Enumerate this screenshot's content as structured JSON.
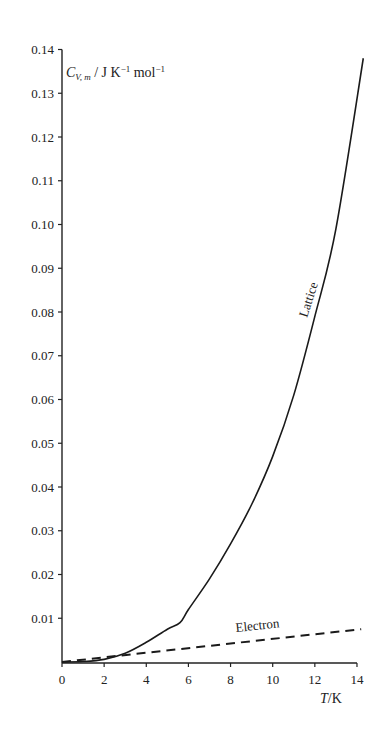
{
  "chart_data": {
    "type": "line",
    "title": "",
    "xlabel": "T/K",
    "ylabel": "C_V,m / J K^-1 mol^-1",
    "xlim": [
      0,
      14.3
    ],
    "ylim": [
      0,
      0.14
    ],
    "x_ticks": [
      0,
      2,
      4,
      6,
      8,
      10,
      12,
      14
    ],
    "x_tick_labels": [
      "0",
      "2",
      "4",
      "6",
      "8",
      "10",
      "12",
      "14"
    ],
    "y_ticks": [
      0.01,
      0.02,
      0.03,
      0.04,
      0.05,
      0.06,
      0.07,
      0.08,
      0.09,
      0.1,
      0.11,
      0.12,
      0.13,
      0.14
    ],
    "y_tick_labels": [
      "0.01",
      "0.02",
      "0.03",
      "0.04",
      "0.05",
      "0.06",
      "0.07",
      "0.08",
      "0.09",
      "0.10",
      "0.11",
      "0.12",
      "0.13",
      "0.14"
    ],
    "grid": false,
    "legend": "inline labels",
    "series": [
      {
        "name": "Lattice",
        "style": "solid",
        "x": [
          0,
          1,
          2,
          3,
          4,
          5,
          5.6,
          6,
          7,
          8,
          9,
          10,
          11,
          12,
          13,
          14.3
        ],
        "y": [
          0,
          0.0001,
          0.0006,
          0.002,
          0.0045,
          0.0075,
          0.009,
          0.012,
          0.019,
          0.027,
          0.036,
          0.047,
          0.061,
          0.079,
          0.099,
          0.138
        ]
      },
      {
        "name": "Electron",
        "style": "dashed",
        "x": [
          0,
          14.2
        ],
        "y": [
          0,
          0.0075
        ]
      }
    ],
    "annotations": [
      {
        "text": "Lattice",
        "x": 10.9,
        "y": 0.072,
        "rotation": -72
      },
      {
        "text": "Electron",
        "x": 11,
        "y": 0.0095,
        "rotation": -6
      }
    ]
  },
  "labels": {
    "y_axis_label_main": "C",
    "y_axis_label_sub": "V, m",
    "y_axis_label_units": " / J K",
    "y_axis_label_exp1": "−1",
    "y_axis_label_mol": " mol",
    "y_axis_label_exp2": "−1",
    "x_axis_label_T": "T",
    "x_axis_label_units": "/K",
    "lattice": "Lattice",
    "electron": "Electron"
  }
}
